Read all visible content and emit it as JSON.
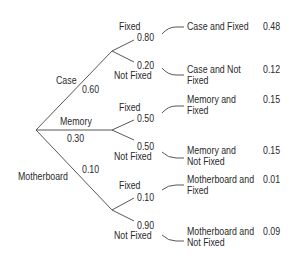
{
  "tree": {
    "root": {
      "branches": [
        {
          "label": "Case",
          "prob": "0.60",
          "children": [
            {
              "label": "Fixed",
              "prob": "0.80",
              "outcome_line1": "Case and Fixed",
              "outcome_line2": "",
              "joint": "0.48"
            },
            {
              "label": "Not Fixed",
              "prob": "0.20",
              "outcome_line1": "Case and Not",
              "outcome_line2": "Fixed",
              "joint": "0.12"
            }
          ]
        },
        {
          "label": "Memory",
          "prob": "0.30",
          "children": [
            {
              "label": "Fixed",
              "prob": "0.50",
              "outcome_line1": "Memory and",
              "outcome_line2": "Fixed",
              "joint": "0.15"
            },
            {
              "label": "Not Fixed",
              "prob": "0.50",
              "outcome_line1": "Memory and",
              "outcome_line2": "Not Fixed",
              "joint": "0.15"
            }
          ]
        },
        {
          "label": "Motherboard",
          "prob": "0.10",
          "children": [
            {
              "label": "Fixed",
              "prob": "0.10",
              "outcome_line1": "Motherboard and",
              "outcome_line2": "Fixed",
              "joint": "0.01"
            },
            {
              "label": "Not Fixed",
              "prob": "0.90",
              "outcome_line1": "Motherboard and",
              "outcome_line2": "Not Fixed",
              "joint": "0.09"
            }
          ]
        }
      ]
    },
    "colors": {
      "line": "#444444",
      "text": "#2a2a2a",
      "background": "#ffffff"
    }
  }
}
